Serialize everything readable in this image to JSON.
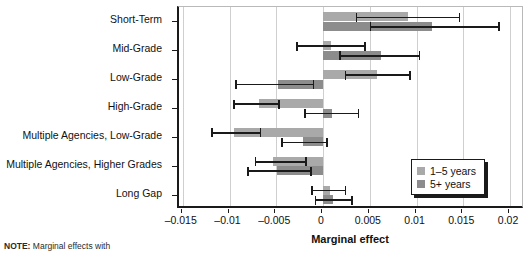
{
  "chart_data": {
    "type": "bar",
    "orientation": "horizontal",
    "title": "",
    "xlabel": "Marginal effect",
    "ylabel": "",
    "xlim": [
      -0.0154,
      0.0216
    ],
    "xticks": [
      -0.015,
      -0.01,
      -0.005,
      0,
      0.005,
      0.01,
      0.015,
      0.02
    ],
    "xticklabels": [
      "–0.015",
      "–0.01",
      "–0.005",
      "0",
      "0.005",
      "0.01",
      "0.015",
      "0.02"
    ],
    "grid": true,
    "legend_position": "bottom-right",
    "categories": [
      "Short-Term",
      "Mid-Grade",
      "Low-Grade",
      "High-Grade",
      "Multiple Agencies, Low-Grade",
      "Multiple Agencies, Higher Grades",
      "Long Gap"
    ],
    "series": [
      {
        "name": "1–5 years",
        "color": "#a9a9a9",
        "values": [
          0.0091,
          0.0009,
          0.0058,
          -0.0068,
          -0.0095,
          -0.0054,
          0.0007
        ],
        "ci_low": [
          0.0036,
          -0.0028,
          0.0024,
          -0.0095,
          -0.0119,
          -0.0072,
          -0.0012
        ],
        "ci_high": [
          0.0146,
          0.0045,
          0.0093,
          -0.0047,
          -0.0067,
          -0.0018,
          0.0024
        ]
      },
      {
        "name": "5+ years",
        "color": "#8c8c8c",
        "values": [
          0.0117,
          0.0062,
          -0.0048,
          0.001,
          -0.0021,
          -0.0049,
          0.0011
        ],
        "ci_low": [
          0.0051,
          0.0018,
          -0.0093,
          -0.0019,
          -0.0044,
          -0.008,
          -0.0008
        ],
        "ci_high": [
          0.0188,
          0.0103,
          -0.001,
          0.0038,
          0.0004,
          -0.0013,
          0.0031
        ]
      }
    ]
  },
  "legend": {
    "items": [
      {
        "label": "1–5 years",
        "color": "#a9a9a9"
      },
      {
        "label": "5+ years",
        "color": "#8c8c8c"
      }
    ]
  },
  "footnote": {
    "prefix": "NOTE:",
    "text": "Marginal effects with"
  }
}
